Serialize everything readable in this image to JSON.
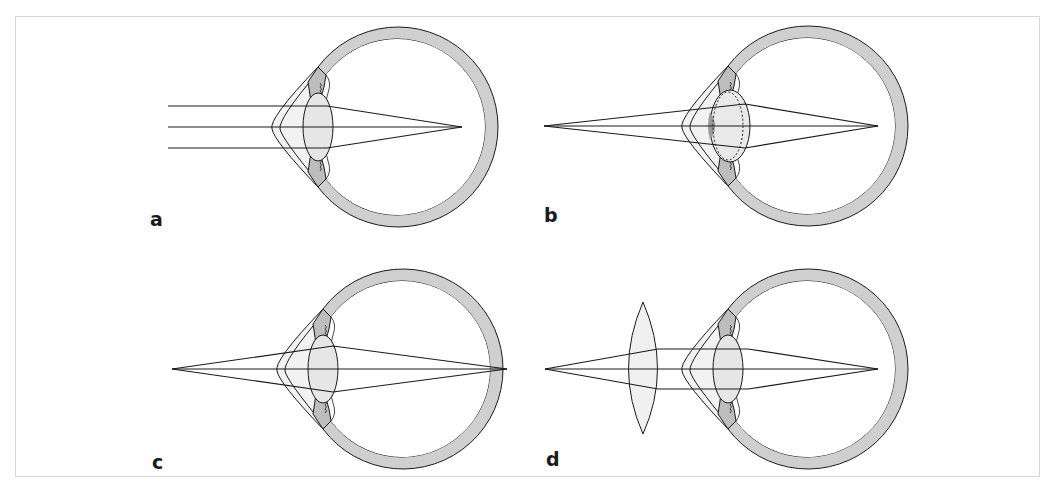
{
  "figure": {
    "panels": [
      {
        "id": "a",
        "label": "a",
        "content": "Parallel rays focused on retina (emmetropic eye)"
      },
      {
        "id": "b",
        "label": "b",
        "content": "Near point source; accommodated lens (thickened, dashed outline) focuses on retina"
      },
      {
        "id": "c",
        "label": "c",
        "content": "Near point source; focus falls behind retina (hyperopia)"
      },
      {
        "id": "d",
        "label": "d",
        "content": "Convex corrective lens in front of eye brings focus onto retina"
      }
    ]
  },
  "colors": {
    "sclera_fill": "#cfcfcf",
    "lens_fill": "#e6e6e6",
    "accommodated_lens_edge": "#9a9a9a",
    "stroke": "#1a1a1a",
    "frame": "#d6d6d6",
    "background": "#ffffff"
  }
}
